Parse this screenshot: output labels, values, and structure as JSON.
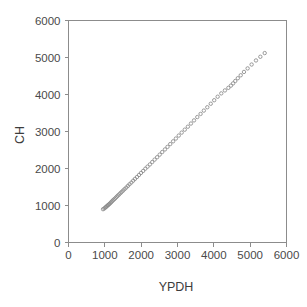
{
  "chart_data": {
    "type": "scatter",
    "title": "",
    "xlabel": "YPDH",
    "ylabel": "CH",
    "xlim": [
      0,
      6000
    ],
    "ylim": [
      0,
      6000
    ],
    "xticks": [
      0,
      1000,
      2000,
      3000,
      4000,
      5000,
      6000
    ],
    "yticks": [
      0,
      1000,
      2000,
      3000,
      4000,
      5000,
      6000
    ],
    "xticklabels": [
      "0",
      "1000",
      "2000",
      "3000",
      "4000",
      "5000",
      "6000"
    ],
    "yticklabels": [
      "0",
      "1000",
      "2000",
      "3000",
      "4000",
      "5000",
      "6000"
    ],
    "grid": false,
    "legend": null,
    "legend_position": "none",
    "marker": "open-circle",
    "marker_color": "#8a8a8a",
    "marker_size": 3.4,
    "frame_color": "#8c8c8c",
    "background_color": "#ffffff",
    "n_points": 72,
    "series": [
      {
        "name": "CH vs YPDH",
        "x": [
          950,
          985,
          1010,
          1030,
          1055,
          1075,
          1095,
          1115,
          1140,
          1165,
          1190,
          1215,
          1240,
          1270,
          1300,
          1330,
          1360,
          1395,
          1430,
          1465,
          1505,
          1545,
          1590,
          1635,
          1680,
          1730,
          1780,
          1830,
          1885,
          1940,
          1995,
          2055,
          2115,
          2175,
          2240,
          2305,
          2370,
          2440,
          2510,
          2580,
          2655,
          2725,
          2800,
          2880,
          2955,
          3035,
          3115,
          3200,
          3285,
          3370,
          3455,
          3545,
          3635,
          3725,
          3820,
          3915,
          4010,
          4105,
          4205,
          4305,
          4400,
          4470,
          4530,
          4590,
          4660,
          4740,
          4830,
          4930,
          5040,
          5160,
          5280,
          5400
        ],
        "y": [
          900,
          920,
          940,
          960,
          980,
          1000,
          1015,
          1035,
          1055,
          1080,
          1105,
          1130,
          1155,
          1180,
          1210,
          1240,
          1270,
          1300,
          1335,
          1370,
          1405,
          1445,
          1485,
          1530,
          1575,
          1620,
          1670,
          1720,
          1770,
          1825,
          1880,
          1935,
          1995,
          2050,
          2110,
          2175,
          2240,
          2305,
          2375,
          2445,
          2515,
          2585,
          2660,
          2735,
          2810,
          2890,
          2970,
          3050,
          3130,
          3215,
          3300,
          3390,
          3475,
          3565,
          3655,
          3750,
          3845,
          3940,
          4030,
          4110,
          4180,
          4240,
          4300,
          4365,
          4440,
          4520,
          4610,
          4705,
          4810,
          4920,
          5020,
          5120
        ]
      }
    ]
  }
}
